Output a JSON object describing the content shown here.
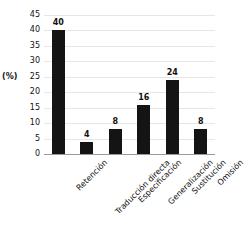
{
  "chart_data": {
    "type": "bar",
    "title": "",
    "subtitle": "",
    "xlabel": "",
    "ylabel": "(%)",
    "ylim": [
      0,
      45
    ],
    "xlim": [
      0,
      6
    ],
    "grid": true,
    "grid_axis": "y",
    "legend": false,
    "legend_position": "none",
    "bar_color": "#141414",
    "background_color": "#ffffff",
    "gridline_color": "#e6e6e6",
    "axis_color": "#9a9a9a",
    "value_labels_shown": true,
    "xtick_rotation": -45,
    "categories": [
      "Retención",
      "Traducción directa",
      "Especificación",
      "Generalización",
      "Sustitución",
      "Omisión"
    ],
    "values": [
      40,
      4,
      8,
      16,
      24,
      8
    ],
    "value_labels": [
      "40",
      "4",
      "8",
      "16",
      "24",
      "8"
    ],
    "yticks": [
      0,
      5,
      10,
      15,
      20,
      25,
      30,
      35,
      40,
      45
    ],
    "ytick_labels": [
      "0",
      "5",
      "10",
      "15",
      "20",
      "25",
      "30",
      "35",
      "40",
      "45"
    ]
  }
}
